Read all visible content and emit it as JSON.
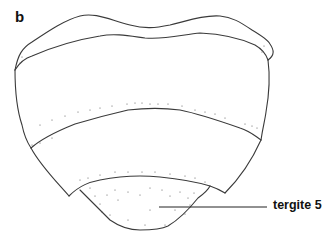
{
  "figure": {
    "panel_letter": "b",
    "callouts": [
      {
        "label": "tergite 5",
        "target": "terminal-segment"
      }
    ],
    "colors": {
      "line": "#3a3a3a",
      "text": "#111111",
      "background": "#ffffff"
    }
  }
}
